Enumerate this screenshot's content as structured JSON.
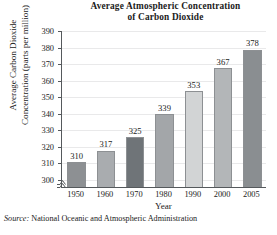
{
  "chart_data": {
    "type": "bar",
    "title": "Average Atmospheric Concentration of Carbon Dioxide",
    "title_line1": "Average Atmospheric Concentration",
    "title_line2": "of Carbon Dioxide",
    "xlabel": "Year",
    "ylabel": "Average Carbon Dioxide Concentration (parts per million)",
    "ylabel_line1": "Average Carbon Dioxide",
    "ylabel_line2": "Concentration (parts per million)",
    "categories": [
      "1950",
      "1960",
      "1970",
      "1980",
      "1990",
      "2000",
      "2005"
    ],
    "values": [
      310,
      317,
      325,
      339,
      353,
      367,
      378
    ],
    "data_labels": [
      "310",
      "317",
      "325",
      "339",
      "353",
      "367",
      "378"
    ],
    "ylim": [
      295,
      390
    ],
    "ytick_labels": [
      "300",
      "310",
      "320",
      "330",
      "340",
      "350",
      "360",
      "370",
      "380",
      "390"
    ],
    "ytick_values": [
      300,
      310,
      320,
      330,
      340,
      350,
      360,
      370,
      380,
      390
    ],
    "grid": true,
    "legend": false,
    "axis_break": true,
    "bar_colors": [
      "#8d9093",
      "#a9acaf",
      "#6f7478",
      "#a3a6a9",
      "#d2d4d5",
      "#b3b6b8",
      "#8a8e91"
    ],
    "axis_color": "#55595c",
    "grid_color": "#e9e9ea",
    "text_color": "#1b1b1b"
  },
  "source": {
    "keyword": "Source:",
    "text": "National Oceanic and Atmospheric Administration"
  }
}
